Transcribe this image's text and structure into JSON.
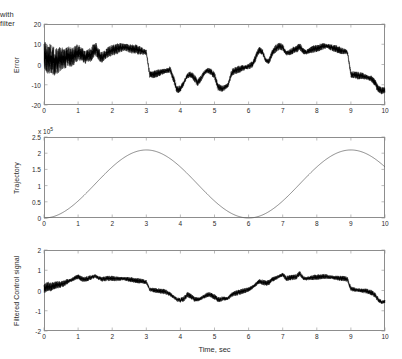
{
  "figure": {
    "title": "with filter",
    "xlabel": "Time, sec",
    "width": 402,
    "height": 359,
    "background": "#ffffff",
    "axis_color": "#8d8d8d",
    "signal_color": "#000000",
    "trajectory_color": "#5a5a5a"
  },
  "chart_data": [
    {
      "type": "line",
      "title": "with filter",
      "ylabel": "Error",
      "xlabel": "",
      "xlim": [
        0,
        10
      ],
      "ylim": [
        -20,
        20
      ],
      "xticks": [
        0,
        1,
        2,
        3,
        4,
        5,
        6,
        7,
        8,
        9,
        10
      ],
      "xticklabels": [
        "0",
        "1",
        "2",
        "3",
        "4",
        "5",
        "6",
        "7",
        "8",
        "9",
        "10"
      ],
      "yticks": [
        -20,
        -10,
        0,
        10,
        20
      ],
      "yticklabels": [
        "-20",
        "-10",
        "0",
        "10",
        "20"
      ],
      "grid": false,
      "legend": null,
      "series": [
        {
          "name": "Error",
          "color": "#000000",
          "description": "Noisy tracking error band; high-frequency noise amplitude decays from about +/-8 near t=0 to about +/-1.5 after t=3",
          "x": [
            0,
            0.1,
            0.2,
            0.3,
            0.4,
            0.5,
            0.6,
            0.7,
            0.8,
            0.9,
            1.0,
            1.1,
            1.2,
            1.3,
            1.4,
            1.5,
            1.6,
            1.7,
            1.8,
            1.9,
            2.0,
            2.1,
            2.2,
            2.3,
            2.4,
            2.5,
            2.6,
            2.7,
            2.8,
            2.9,
            3.0,
            3.1,
            3.2,
            3.3,
            3.4,
            3.5,
            3.6,
            3.7,
            3.8,
            3.9,
            4.0,
            4.1,
            4.2,
            4.3,
            4.4,
            4.5,
            4.6,
            4.7,
            4.8,
            4.9,
            5.0,
            5.1,
            5.2,
            5.3,
            5.4,
            5.5,
            5.6,
            5.7,
            5.8,
            5.9,
            6.0,
            6.1,
            6.2,
            6.3,
            6.4,
            6.5,
            6.6,
            6.7,
            6.8,
            6.9,
            7.0,
            7.1,
            7.2,
            7.3,
            7.4,
            7.5,
            7.6,
            7.7,
            7.8,
            7.9,
            8.0,
            8.1,
            8.2,
            8.3,
            8.4,
            8.5,
            8.6,
            8.7,
            8.8,
            8.9,
            9.0,
            9.1,
            9.2,
            9.3,
            9.4,
            9.5,
            9.6,
            9.7,
            9.8,
            9.9,
            10.0
          ],
          "y": [
            6.0,
            2.5,
            3.0,
            1.5,
            2.0,
            3.0,
            2.5,
            4.0,
            3.5,
            4.5,
            6.0,
            5.0,
            3.5,
            4.0,
            5.5,
            8.0,
            5.0,
            3.5,
            5.0,
            6.5,
            7.0,
            7.5,
            8.0,
            8.5,
            8.5,
            8.0,
            7.5,
            7.5,
            7.0,
            6.5,
            6.0,
            -5.0,
            -5.0,
            -4.5,
            -4.0,
            -3.5,
            -3.0,
            -2.5,
            -7.0,
            -12.5,
            -12.0,
            -9.0,
            -5.5,
            -5.0,
            -6.5,
            -9.0,
            -7.0,
            -4.0,
            -3.0,
            -3.5,
            -5.5,
            -11.0,
            -12.0,
            -11.5,
            -10.0,
            -4.0,
            -3.0,
            -2.5,
            -2.0,
            -1.5,
            -1.0,
            0.0,
            3.0,
            7.0,
            6.5,
            2.0,
            1.5,
            6.0,
            8.0,
            9.0,
            8.5,
            5.5,
            6.0,
            7.0,
            7.5,
            9.0,
            6.5,
            6.0,
            7.0,
            7.5,
            8.0,
            8.5,
            9.0,
            9.0,
            8.5,
            8.0,
            7.5,
            7.0,
            6.5,
            6.0,
            -5.0,
            -5.0,
            -5.5,
            -5.5,
            -6.0,
            -6.5,
            -7.0,
            -9.0,
            -12.0,
            -13.0,
            -12.5
          ]
        }
      ]
    },
    {
      "type": "line",
      "title": "",
      "ylabel": "Trajectory",
      "xlabel": "",
      "y_exponent_label": "x 10",
      "y_exponent_power": "5",
      "xlim": [
        0,
        10
      ],
      "ylim": [
        0,
        250000
      ],
      "xticks": [
        0,
        1,
        2,
        3,
        4,
        5,
        6,
        7,
        8,
        9,
        10
      ],
      "xticklabels": [
        "0",
        "1",
        "2",
        "3",
        "4",
        "5",
        "6",
        "7",
        "8",
        "9",
        "10"
      ],
      "yticks": [
        0,
        50000,
        100000,
        150000,
        200000,
        250000
      ],
      "yticklabels": [
        "0",
        "0.5",
        "1",
        "1.5",
        "2",
        "2.5"
      ],
      "grid": false,
      "legend": null,
      "series": [
        {
          "name": "Trajectory",
          "color": "#5a5a5a",
          "description": "Raised cosine reference, period 6 s, amplitude 2.1e5, minima at t=0 and t=6, maxima at t=3 and t=9",
          "x": [
            0,
            0.5,
            1.0,
            1.5,
            2.0,
            2.5,
            3.0,
            3.5,
            4.0,
            4.5,
            5.0,
            5.5,
            6.0,
            6.5,
            7.0,
            7.5,
            8.0,
            8.5,
            9.0,
            9.5,
            10.0
          ],
          "y": [
            0,
            14000,
            52500,
            105000,
            157500,
            196000,
            210000,
            196000,
            157500,
            105000,
            52500,
            14000,
            0,
            14000,
            52500,
            105000,
            157500,
            196000,
            210000,
            196000,
            157500
          ]
        }
      ]
    },
    {
      "type": "line",
      "title": "",
      "ylabel": "Filtered Control signal",
      "xlabel": "Time, sec",
      "xlim": [
        0,
        10
      ],
      "ylim": [
        -2,
        2
      ],
      "xticks": [
        0,
        1,
        2,
        3,
        4,
        5,
        6,
        7,
        8,
        9,
        10
      ],
      "xticklabels": [
        "0",
        "1",
        "2",
        "3",
        "4",
        "5",
        "6",
        "7",
        "8",
        "9",
        "10"
      ],
      "yticks": [
        -2,
        -1,
        0,
        1,
        2
      ],
      "yticklabels": [
        "-2",
        "-1",
        "0",
        "1",
        "2"
      ],
      "grid": false,
      "legend": null,
      "series": [
        {
          "name": "Filtered Control signal",
          "color": "#000000",
          "description": "Filtered control effort, low noise band of about +/-0.08, steps down at t=3 and t=9",
          "x": [
            0,
            0.1,
            0.2,
            0.3,
            0.4,
            0.5,
            0.6,
            0.7,
            0.8,
            0.9,
            1.0,
            1.1,
            1.2,
            1.3,
            1.4,
            1.5,
            1.6,
            1.7,
            1.8,
            1.9,
            2.0,
            2.1,
            2.2,
            2.3,
            2.4,
            2.5,
            2.6,
            2.7,
            2.8,
            2.9,
            3.0,
            3.1,
            3.2,
            3.3,
            3.4,
            3.5,
            3.6,
            3.7,
            3.8,
            3.9,
            4.0,
            4.1,
            4.2,
            4.3,
            4.4,
            4.5,
            4.6,
            4.7,
            4.8,
            4.9,
            5.0,
            5.1,
            5.2,
            5.3,
            5.4,
            5.5,
            5.6,
            5.7,
            5.8,
            5.9,
            6.0,
            6.1,
            6.2,
            6.3,
            6.4,
            6.5,
            6.6,
            6.7,
            6.8,
            6.9,
            7.0,
            7.1,
            7.2,
            7.3,
            7.4,
            7.5,
            7.6,
            7.7,
            7.8,
            7.9,
            8.0,
            8.1,
            8.2,
            8.3,
            8.4,
            8.5,
            8.6,
            8.7,
            8.8,
            8.9,
            9.0,
            9.1,
            9.2,
            9.3,
            9.4,
            9.5,
            9.6,
            9.7,
            9.8,
            9.9,
            10.0
          ],
          "y": [
            0.1,
            0.2,
            0.18,
            0.25,
            0.28,
            0.3,
            0.35,
            0.45,
            0.52,
            0.6,
            0.68,
            0.58,
            0.55,
            0.6,
            0.65,
            0.72,
            0.6,
            0.55,
            0.58,
            0.6,
            0.6,
            0.58,
            0.57,
            0.58,
            0.58,
            0.55,
            0.52,
            0.5,
            0.48,
            0.45,
            0.42,
            0.05,
            0.02,
            0.0,
            -0.02,
            -0.05,
            -0.1,
            -0.18,
            -0.32,
            -0.45,
            -0.48,
            -0.42,
            -0.2,
            -0.28,
            -0.42,
            -0.45,
            -0.4,
            -0.3,
            -0.2,
            -0.22,
            -0.32,
            -0.45,
            -0.42,
            -0.4,
            -0.38,
            -0.22,
            -0.15,
            -0.1,
            -0.05,
            0.0,
            0.05,
            0.15,
            0.28,
            0.45,
            0.42,
            0.35,
            0.4,
            0.55,
            0.62,
            0.7,
            0.78,
            0.6,
            0.62,
            0.65,
            0.68,
            0.85,
            0.62,
            0.58,
            0.62,
            0.65,
            0.66,
            0.68,
            0.7,
            0.68,
            0.66,
            0.64,
            0.62,
            0.6,
            0.58,
            0.56,
            0.08,
            0.05,
            0.02,
            0.0,
            -0.02,
            -0.05,
            -0.1,
            -0.22,
            -0.45,
            -0.58,
            -0.55
          ]
        }
      ]
    }
  ]
}
